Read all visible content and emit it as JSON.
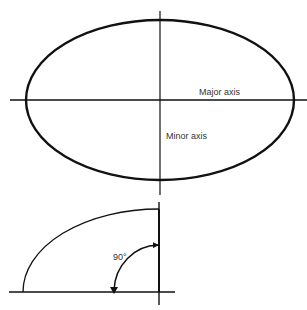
{
  "diagram": {
    "type": "geometry-illustration",
    "ellipse": {
      "labels": {
        "major_axis": "Major axis",
        "minor_axis": "Minor axis"
      }
    },
    "quadrant": {
      "angle_label": "90°"
    }
  },
  "colors": {
    "stroke": "#111111",
    "label": "#333333",
    "background": "#ffffff"
  }
}
